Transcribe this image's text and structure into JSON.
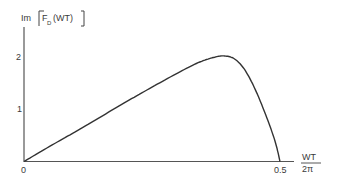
{
  "chart_data": {
    "type": "line",
    "title": "",
    "xlabel": "WT/2π",
    "xlabel_num": "WT",
    "xlabel_den": "2π",
    "ylabel": "Im [F_D(WT)]",
    "ylabel_parts": {
      "prefix": "Im",
      "func": "F",
      "sub": "D",
      "arg": "(WT)"
    },
    "xlim": [
      0,
      0.52
    ],
    "ylim": [
      0,
      2.6
    ],
    "x_ticks": [
      {
        "value": 0,
        "label": "0"
      },
      {
        "value": 0.5,
        "label": "0.5"
      }
    ],
    "y_ticks": [
      {
        "value": 1,
        "label": "1"
      },
      {
        "value": 2,
        "label": "2"
      }
    ],
    "grid": false,
    "legend": null,
    "series": [
      {
        "name": "Im F_D(WT)",
        "x": [
          0,
          0.05,
          0.1,
          0.15,
          0.2,
          0.25,
          0.3,
          0.34,
          0.37,
          0.39,
          0.41,
          0.43,
          0.45,
          0.47,
          0.49,
          0.5
        ],
        "values": [
          0,
          0.29,
          0.57,
          0.86,
          1.15,
          1.43,
          1.7,
          1.9,
          2.0,
          2.03,
          1.98,
          1.78,
          1.42,
          0.95,
          0.4,
          0
        ]
      }
    ]
  }
}
